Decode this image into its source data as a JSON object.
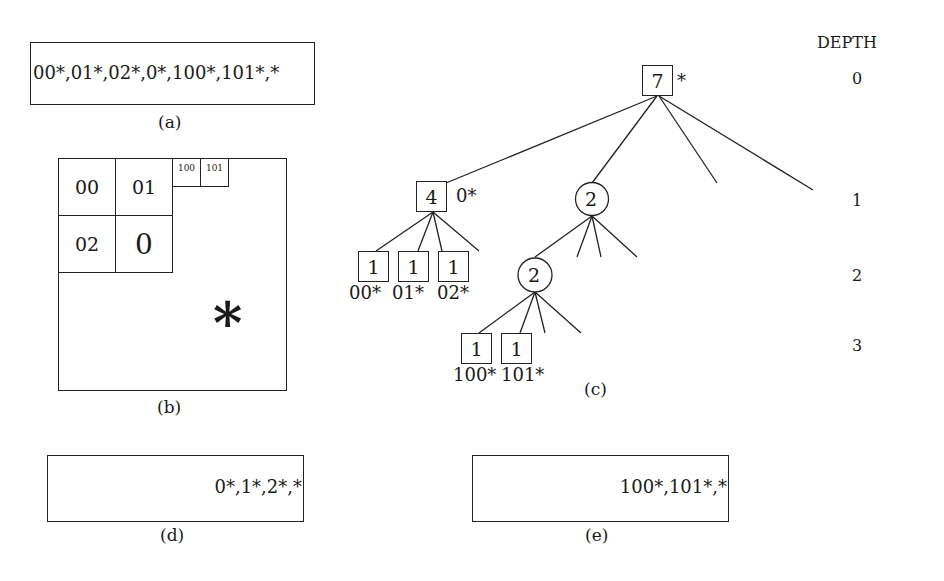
{
  "panel_a": {
    "caption": "(a)",
    "sequence": "00*,01*,02*,0*,100*,101*,*"
  },
  "panel_b": {
    "caption": "(b)",
    "cells": [
      {
        "label": "00"
      },
      {
        "label": "01"
      },
      {
        "label": "02"
      },
      {
        "label": "0"
      },
      {
        "label": "100"
      },
      {
        "label": "101"
      }
    ],
    "remainder_label": "*"
  },
  "panel_c": {
    "caption": "(c)",
    "depth_header": "DEPTH",
    "depths": [
      "0",
      "1",
      "2",
      "3"
    ],
    "nodes": {
      "root": {
        "value": "7",
        "shape": "square",
        "label": "*"
      },
      "n4": {
        "value": "4",
        "shape": "square",
        "label": "0*"
      },
      "c1": {
        "value": "2",
        "shape": "circle"
      },
      "c2": {
        "value": "2",
        "shape": "circle"
      },
      "l00": {
        "value": "1",
        "shape": "square",
        "label": "00*"
      },
      "l01": {
        "value": "1",
        "shape": "square",
        "label": "01*"
      },
      "l02": {
        "value": "1",
        "shape": "square",
        "label": "02*"
      },
      "l100": {
        "value": "1",
        "shape": "square",
        "label": "100*"
      },
      "l101": {
        "value": "1",
        "shape": "square",
        "label": "101*"
      }
    }
  },
  "panel_d": {
    "caption": "(d)",
    "sequence": "0*,1*,2*,*"
  },
  "panel_e": {
    "caption": "(e)",
    "sequence": "100*,101*,*"
  }
}
